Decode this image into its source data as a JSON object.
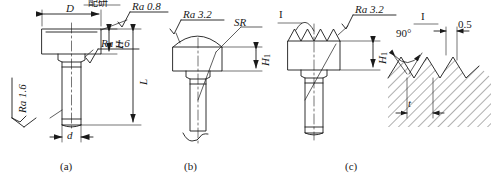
{
  "figure": {
    "type": "engineering-drawing",
    "captions": [
      {
        "id": "a",
        "text": "(a)"
      },
      {
        "id": "b",
        "text": "(b)"
      },
      {
        "id": "c",
        "text": "(c)"
      }
    ]
  },
  "view_a": {
    "name": "flat-head-variant",
    "dimensions": [
      {
        "key": "D",
        "text": "D",
        "meaning": "head diameter"
      },
      {
        "key": "H",
        "text": "H",
        "meaning": "head height"
      },
      {
        "key": "L",
        "text": "L",
        "meaning": "overall length"
      },
      {
        "key": "d",
        "text": "d",
        "meaning": "shank diameter"
      }
    ],
    "notes": [
      {
        "key": "fit_note",
        "text": "配研",
        "meaning": "matched lapping / fit-grinding"
      }
    ],
    "roughness": [
      {
        "key": "top",
        "text": "Ra 0.8",
        "value": 0.8
      },
      {
        "key": "neck",
        "text": "Ra 1.6",
        "value": 1.6
      },
      {
        "key": "shank",
        "text": "Ra 1.6",
        "value": 1.6
      }
    ]
  },
  "view_b": {
    "name": "spherical-head-variant",
    "dimensions": [
      {
        "key": "H1",
        "text": "H",
        "sub": "1",
        "meaning": "head height"
      },
      {
        "key": "SR",
        "text": "SR",
        "meaning": "spherical radius"
      }
    ],
    "roughness": [
      {
        "key": "sphere",
        "text": "Ra 3.2",
        "value": 3.2
      }
    ]
  },
  "view_c": {
    "name": "serrated-head-variant",
    "dimensions": [
      {
        "key": "H1",
        "text": "H",
        "sub": "1",
        "meaning": "head height"
      }
    ],
    "detail_marker": {
      "key": "I",
      "text": "I"
    },
    "roughness": [
      {
        "key": "serration",
        "text": "Ra 3.2",
        "value": 3.2
      }
    ]
  },
  "detail_I": {
    "name": "serration-profile-detail",
    "marker": "I",
    "labels": [
      {
        "key": "angle",
        "text": "90°",
        "meaning": "included tooth angle"
      },
      {
        "key": "width",
        "text": "0.5",
        "meaning": "flat / land width"
      },
      {
        "key": "pitch",
        "text": "t",
        "meaning": "tooth pitch"
      }
    ]
  },
  "style": {
    "line_color": "#1a1a1a",
    "text_color": "#1a1a1a",
    "background": "#ffffff"
  }
}
